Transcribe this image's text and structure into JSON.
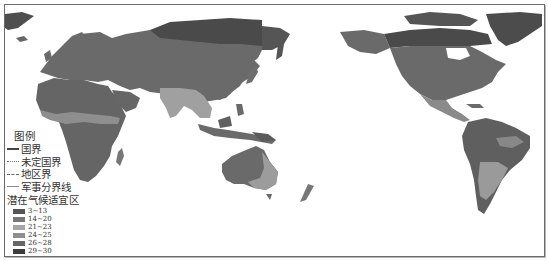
{
  "legend": {
    "title": "图例",
    "boundaries": [
      {
        "label": "国界",
        "style": "solid"
      },
      {
        "label": "未定国界",
        "style": "dotted"
      },
      {
        "label": "地区界",
        "style": "dash"
      },
      {
        "label": "军事分界线",
        "style": "thin"
      }
    ],
    "zone_title": "潜在气候适宜区",
    "zones": [
      {
        "label": "3~13",
        "color": "#555555"
      },
      {
        "label": "14~20",
        "color": "#787878"
      },
      {
        "label": "21~23",
        "color": "#a6a6a6"
      },
      {
        "label": "24~25",
        "color": "#8e8e8e"
      },
      {
        "label": "26~28",
        "color": "#666666"
      },
      {
        "label": "29~30",
        "color": "#3c3c3c"
      }
    ]
  },
  "map": {
    "projection": "Pacific-centered world map",
    "land_base_color": "#6e6e6e",
    "regions": [
      {
        "name": "Eurasia",
        "zone": "26~28"
      },
      {
        "name": "Siberia-north",
        "zone": "29~30"
      },
      {
        "name": "South-Asia",
        "zone": "21~23"
      },
      {
        "name": "Africa",
        "zone": "26~28"
      },
      {
        "name": "Sahel",
        "zone": "24~25"
      },
      {
        "name": "Australia-interior",
        "zone": "26~28"
      },
      {
        "name": "Australia-east",
        "zone": "21~23"
      },
      {
        "name": "North-America",
        "zone": "26~28"
      },
      {
        "name": "Canada-north",
        "zone": "29~30"
      },
      {
        "name": "Greenland",
        "zone": "29~30"
      },
      {
        "name": "South-America",
        "zone": "26~28"
      },
      {
        "name": "South-America-south",
        "zone": "21~23"
      }
    ]
  }
}
